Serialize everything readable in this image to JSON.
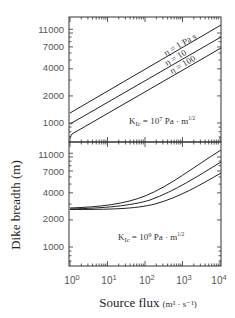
{
  "figure": {
    "ylabel": "Dike breadth (m)",
    "xlabel_main": "Source flux",
    "xlabel_units": "(m³ · s⁻¹)"
  },
  "chart_data": [
    {
      "type": "line",
      "panel": "upper",
      "title": "",
      "annotation": "K_Ic = 10^7 Pa · m^1/2",
      "annotation_parts": {
        "k": "K",
        "sub": "Ic",
        "eq": " = 10",
        "exp": "7",
        "unit": " Pa · m",
        "unit_exp": "1/2"
      },
      "xscale": "log",
      "yscale": "log",
      "xlim": [
        1,
        10000
      ],
      "ylim": [
        700,
        14000
      ],
      "x_ticks": [
        "10^0",
        "10^1",
        "10^2",
        "10^3",
        "10^4"
      ],
      "y_ticks": [
        1000,
        2000,
        4000,
        7000,
        11000
      ],
      "x": [
        1,
        10,
        100,
        1000,
        10000
      ],
      "series": [
        {
          "name": "η = 1 Pa s",
          "values": [
            1250,
            2150,
            3700,
            6400,
            11800
          ]
        },
        {
          "name": "η = 10",
          "values": [
            950,
            1650,
            2850,
            4900,
            8800
          ]
        },
        {
          "name": "η = 100",
          "values": [
            700,
            1250,
            2200,
            3800,
            6700
          ]
        }
      ],
      "series_labels": [
        "η = 1 Pa s",
        "η = 10",
        "η = 100"
      ]
    },
    {
      "type": "line",
      "panel": "lower",
      "title": "",
      "annotation": "K_Ic = 10^9 Pa · m^1/2",
      "annotation_parts": {
        "k": "K",
        "sub": "Ic",
        "eq": " = 10",
        "exp": "9",
        "unit": " Pa · m",
        "unit_exp": "1/2"
      },
      "xscale": "log",
      "yscale": "log",
      "xlim": [
        1,
        10000
      ],
      "ylim": [
        700,
        14000
      ],
      "x_ticks": [
        "10^0",
        "10^1",
        "10^2",
        "10^3",
        "10^4"
      ],
      "y_ticks": [
        1000,
        2000,
        4000,
        7000,
        11000
      ],
      "x": [
        1,
        10,
        100,
        1000,
        10000
      ],
      "series": [
        {
          "name": "η = 1 Pa s",
          "values": [
            2750,
            2950,
            3800,
            6500,
            12500
          ]
        },
        {
          "name": "η = 10",
          "values": [
            2700,
            2800,
            3300,
            5200,
            9700
          ]
        },
        {
          "name": "η = 100",
          "values": [
            2680,
            2720,
            2950,
            4300,
            7700
          ]
        }
      ],
      "xlabel": "Source flux (m³ · s⁻¹)",
      "ylabel": "Dike breadth (m)"
    }
  ],
  "axes": {
    "y_tick_labels": [
      "11000",
      "7000",
      "4000",
      "2000",
      "1000"
    ],
    "x_tick_base": [
      "10",
      "10",
      "10",
      "10",
      "10"
    ],
    "x_tick_exp": [
      "0",
      "1",
      "2",
      "3",
      "4"
    ]
  },
  "upper_labels": {
    "eta1": "η = 1 Pa s",
    "eta10": "η = 10",
    "eta100": "η = 100"
  }
}
